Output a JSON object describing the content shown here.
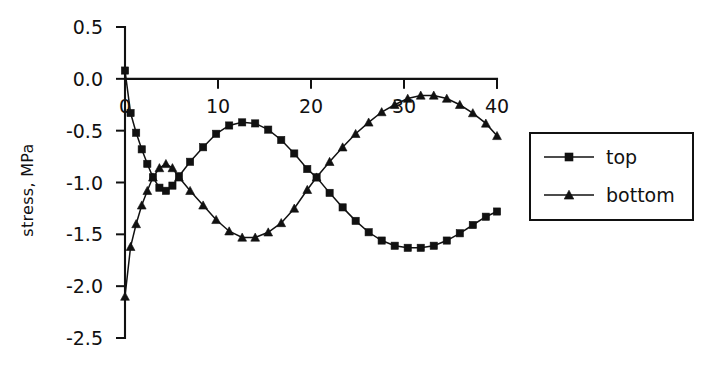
{
  "chart_data": {
    "type": "line",
    "title": "",
    "xlabel": "",
    "ylabel": "stress, MPa",
    "xlim": [
      0,
      40
    ],
    "ylim": [
      -2.5,
      0.5
    ],
    "xticks": [
      0,
      10,
      20,
      30,
      40
    ],
    "yticks": [
      0.5,
      0.0,
      -0.5,
      -1.0,
      -1.5,
      -2.0,
      -2.5
    ],
    "xtick_labels": [
      "0",
      "10",
      "20",
      "30",
      "40"
    ],
    "ytick_labels": [
      "0.5",
      "0.0",
      "-0.5",
      "-1.0",
      "-1.5",
      "-2.0",
      "-2.5"
    ],
    "grid": false,
    "legend_position": "right",
    "x": [
      0,
      0.6,
      1.2,
      1.8,
      2.4,
      3.0,
      3.7,
      4.4,
      5.1,
      5.8,
      7.0,
      8.4,
      9.8,
      11.2,
      12.6,
      14.0,
      15.4,
      16.8,
      18.2,
      19.6,
      20.6,
      22.0,
      23.4,
      24.8,
      26.2,
      27.6,
      29.0,
      30.4,
      31.8,
      33.2,
      34.6,
      36.0,
      37.4,
      38.8,
      40.0
    ],
    "series": [
      {
        "name": "top",
        "marker": "square",
        "values": [
          0.08,
          -0.33,
          -0.52,
          -0.68,
          -0.82,
          -0.95,
          -1.05,
          -1.08,
          -1.03,
          -0.94,
          -0.8,
          -0.66,
          -0.53,
          -0.45,
          -0.42,
          -0.43,
          -0.49,
          -0.59,
          -0.72,
          -0.87,
          -0.95,
          -1.1,
          -1.24,
          -1.37,
          -1.48,
          -1.56,
          -1.61,
          -1.63,
          -1.63,
          -1.61,
          -1.56,
          -1.49,
          -1.41,
          -1.33,
          -1.28
        ]
      },
      {
        "name": "bottom",
        "marker": "triangle",
        "values": [
          -2.1,
          -1.62,
          -1.4,
          -1.22,
          -1.08,
          -0.95,
          -0.86,
          -0.82,
          -0.86,
          -0.95,
          -1.08,
          -1.22,
          -1.36,
          -1.47,
          -1.53,
          -1.53,
          -1.48,
          -1.39,
          -1.25,
          -1.07,
          -0.95,
          -0.8,
          -0.66,
          -0.53,
          -0.42,
          -0.32,
          -0.25,
          -0.19,
          -0.16,
          -0.16,
          -0.19,
          -0.25,
          -0.33,
          -0.43,
          -0.55
        ]
      }
    ],
    "legend": [
      {
        "label": "top",
        "marker": "square"
      },
      {
        "label": "bottom",
        "marker": "triangle"
      }
    ]
  }
}
